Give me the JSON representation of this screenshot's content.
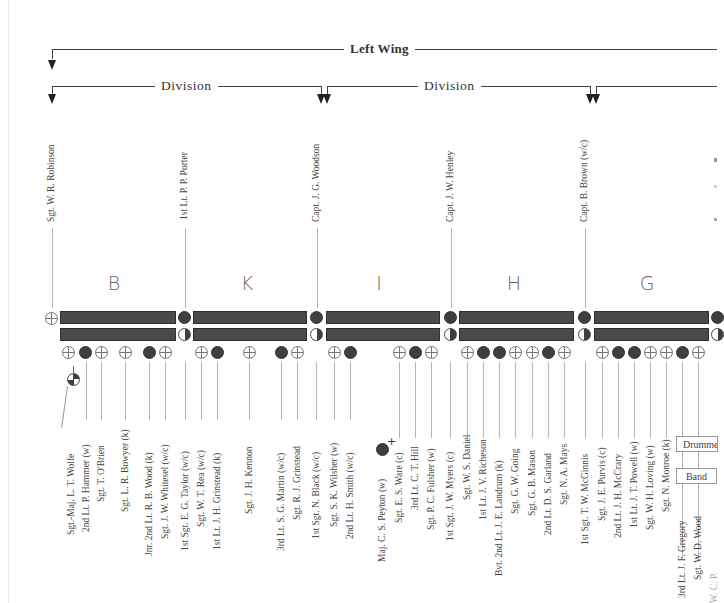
{
  "brackets": {
    "wing": {
      "label": "Left Wing"
    },
    "divisions": [
      {
        "label": "Division"
      },
      {
        "label": "Division"
      }
    ]
  },
  "officers_top": [
    {
      "name": "Sgt. W. R. Robinson",
      "symbol": "cross"
    },
    {
      "name": "1st Lt. P. P. Porter",
      "symbol": "filled"
    },
    {
      "name": "Capt. J. G. Woodson",
      "symbol": "filled"
    },
    {
      "name": "Capt. J. W. Henley",
      "symbol": "filled"
    },
    {
      "name": "Capt. B. Brown (w/c)",
      "symbol": "filled"
    }
  ],
  "companies": [
    {
      "letter": "B",
      "rear_symbols": [
        "cross",
        "filled",
        "cross",
        "gap",
        "cross",
        "gap",
        "filled",
        "cross"
      ],
      "names": [
        "Sgt.-Maj. L. T. Wolfe",
        "2nd Lt. P. Hammer (w)",
        "Sgt. T. O'Brien",
        "Sgt. L. R. Bowyer (k)",
        "Jnr. 2nd Lt. R. B. Wood (k)",
        "Sgt. J. W. Whitesel (w/c)"
      ]
    },
    {
      "letter": "K",
      "rear_symbols": [
        "cross",
        "filled",
        "gap",
        "cross",
        "gap",
        "filled",
        "cross"
      ],
      "names": [
        "1st Sgt. E. G. Taylor (w/c)",
        "Sgt. W. T. Rea (w/c)",
        "1st Lt. J. H. Grinstead (k)",
        "Sgt. J. H. Kennon",
        "3rd Lt. S. G. Martin (w/c)",
        "Sgt. R. J. Grinstead"
      ]
    },
    {
      "letter": "I",
      "rear_symbols": [
        "cross",
        "filled",
        "gap",
        "gap",
        "cross",
        "filled",
        "cross"
      ],
      "names": [
        "1st Sgt. N. Black (w/c)",
        "Sgt. S. K. Wilsher (w)",
        "2nd Lt. H. Smith (w/c)",
        "Maj. C. S. Peyton (w)",
        "Sgt. E. S. Ware (c)",
        "3rd Lt. C. T. Hill",
        "Sgt. P. C. Fulsher (w)"
      ]
    },
    {
      "letter": "H",
      "rear_symbols": [
        "cross",
        "filled",
        "filled",
        "cross",
        "cross",
        "filled",
        "cross"
      ],
      "names": [
        "1st Sgt. J. W. Myers (c)",
        "Sgt. W. S. Daniel",
        "1st Lt. J. V. Richeson",
        "Bvt. 2nd Lt. J. E. Landrum (k)",
        "Sgt. G. W. Going",
        "Sgt. G. B. Mason",
        "2nd Lt. D. S. Garland",
        "Sgt. N. A. Mays"
      ]
    },
    {
      "letter": "G",
      "rear_symbols": [
        "cross",
        "filled",
        "filled",
        "cross",
        "cross",
        "filled",
        "cross"
      ],
      "names": [
        "1st Sgt. T. W. McGinnis",
        "Sgt. J. E. Purvis (c)",
        "2nd Lt. J. H. McCrary",
        "1st Lt. J. T. Powell (w)",
        "Sgt. W. H. Loving (w)",
        "Sgt. N. Monroe (k)",
        "3rd Lt. J. F. Gregory",
        "Sgt. W. D. Wood",
        "W. C. P."
      ]
    }
  ],
  "legend": {
    "drummers": "Drummers",
    "band": "Band"
  },
  "colors": {
    "bar": "#4a4a4a",
    "line": "#444444",
    "stem": "#b5b5b5"
  }
}
